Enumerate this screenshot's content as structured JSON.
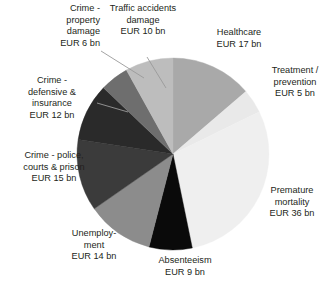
{
  "chart_data": {
    "type": "pie",
    "title": "",
    "subtitle": "",
    "unit": "EUR bn",
    "total": 124,
    "legend_position": "callout-labels",
    "start_angle_deg": 0,
    "direction": "clockwise",
    "categories": [
      "Healthcare",
      "Treatment / prevention",
      "Premature mortality",
      "Absenteeism",
      "Unemployment",
      "Crime - police, courts & prison",
      "Crime - defensive & insurance",
      "Crime - property damage",
      "Traffic accidents damage"
    ],
    "values": [
      17,
      5,
      36,
      9,
      14,
      15,
      12,
      6,
      10
    ],
    "colors": [
      "#a9a9a9",
      "#e9e9e9",
      "#efefef",
      "#0a0a0a",
      "#8c8c8c",
      "#3b3b3b",
      "#2a2a2a",
      "#6e6e6e",
      "#bdbdbd"
    ],
    "slices": [
      {
        "name": "healthcare",
        "label": "Healthcare",
        "value_text": "EUR 17 bn",
        "value": 17,
        "color": "#a9a9a9"
      },
      {
        "name": "treatment",
        "label": "Treatment /\nprevention",
        "value_text": "EUR 5 bn",
        "value": 5,
        "color": "#e9e9e9"
      },
      {
        "name": "premature-mortality",
        "label": "Premature\nmortality",
        "value_text": "EUR 36 bn",
        "value": 36,
        "color": "#efefef"
      },
      {
        "name": "absenteeism",
        "label": "Absenteeism",
        "value_text": "EUR 9 bn",
        "value": 9,
        "color": "#0a0a0a"
      },
      {
        "name": "unemployment",
        "label": "Unemploy-\nment",
        "value_text": "EUR 14 bn",
        "value": 14,
        "color": "#8c8c8c"
      },
      {
        "name": "crime-police",
        "label": "Crime - police,\ncourts & prison",
        "value_text": "EUR 15 bn",
        "value": 15,
        "color": "#3b3b3b"
      },
      {
        "name": "crime-defensive",
        "label": "Crime -\ndefensive &\ninsurance",
        "value_text": "EUR 12 bn",
        "value": 12,
        "color": "#2a2a2a"
      },
      {
        "name": "crime-property",
        "label": "Crime -\nproperty\ndamage",
        "value_text": "EUR 6 bn",
        "value": 6,
        "color": "#6e6e6e"
      },
      {
        "name": "traffic-accidents",
        "label": "Traffic accidents\ndamage",
        "value_text": "EUR 10 bn",
        "value": 10,
        "color": "#bdbdbd"
      }
    ]
  },
  "labels": {
    "crime_property": "Crime -\nproperty\ndamage\nEUR 6 bn",
    "traffic": "Traffic accidents\ndamage\nEUR 10 bn",
    "healthcare": "Healthcare\nEUR 17 bn",
    "treatment": "Treatment /\nprevention\nEUR 5 bn",
    "premature": "Premature\nmortality\nEUR 36 bn",
    "absenteeism": "Absenteeism\nEUR 9 bn",
    "unemployment": "Unemploy-\nment\nEUR 14 bn",
    "crime_police": "Crime - police,\ncourts & prison\nEUR 15 bn",
    "crime_defensive": "Crime -\ndefensive &\ninsurance\nEUR 12 bn"
  },
  "style": {
    "text_color": "#231f20",
    "background": "#ffffff",
    "leader_line_color": "#9a9a9a"
  }
}
